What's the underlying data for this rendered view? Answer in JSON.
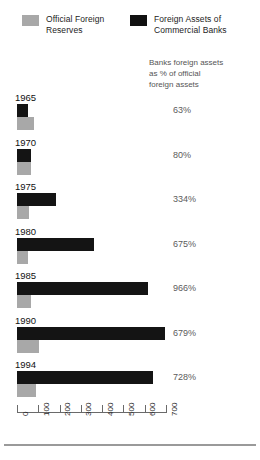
{
  "legend": {
    "items": [
      {
        "label": "Official Foreign\nReserves",
        "swatch": "gray",
        "color": "#a8a8a8"
      },
      {
        "label": "Foreign Assets of\nCommercial Banks",
        "swatch": "black",
        "color": "#141414"
      }
    ]
  },
  "column_header": "Banks foreign assets\nas % of official\nforeign assets",
  "axis": {
    "ticks": [
      "0",
      "100",
      "200",
      "300",
      "400",
      "500",
      "600",
      "700"
    ]
  },
  "chart_data": {
    "type": "bar",
    "orientation": "horizontal",
    "title": "",
    "subtitle": "",
    "xlabel": "",
    "ylabel": "",
    "xlim": [
      0,
      700
    ],
    "grid": false,
    "legend_position": "top",
    "categories": [
      "1965",
      "1970",
      "1975",
      "1980",
      "1985",
      "1990",
      "1994"
    ],
    "series": [
      {
        "name": "Foreign Assets of Commercial Banks",
        "color": "#141414",
        "values": [
          50,
          65,
          185,
          360,
          615,
          695,
          640
        ]
      },
      {
        "name": "Official Foreign Reserves",
        "color": "#a8a8a8",
        "values": [
          80,
          65,
          55,
          53,
          64,
          102,
          88
        ]
      }
    ],
    "annotations": {
      "label": "Banks foreign assets as % of official foreign assets",
      "values": [
        "63%",
        "80%",
        "334%",
        "675%",
        "966%",
        "679%",
        "728%"
      ]
    }
  }
}
